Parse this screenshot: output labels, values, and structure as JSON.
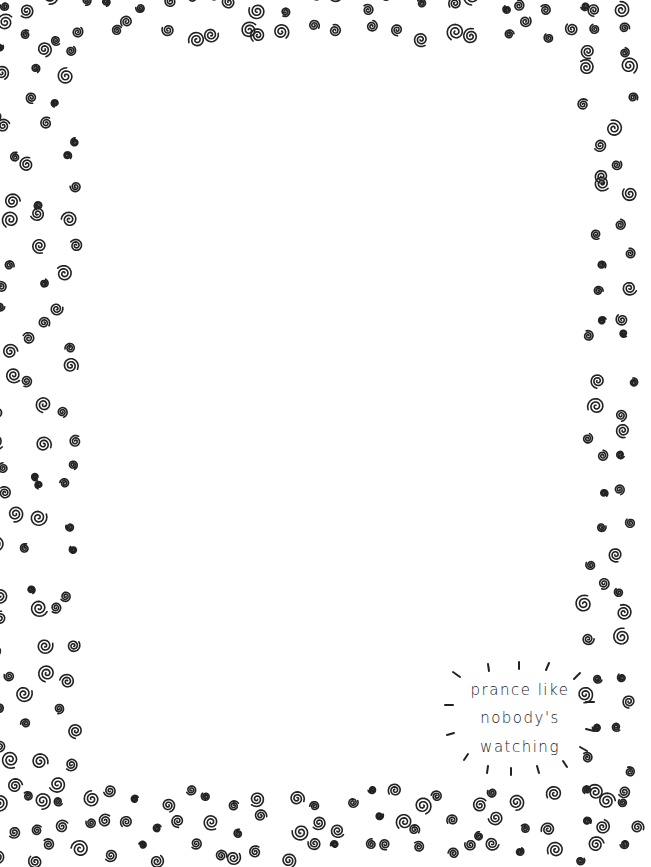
{
  "colors": {
    "ink": "#222222",
    "background": "#ffffff"
  },
  "border": {
    "icon": "swirl-icon",
    "style": "hand-drawn spirals"
  },
  "quote": {
    "lines": [
      "prance like",
      "nobody's",
      "watching"
    ],
    "decoration": "sunburst-rays"
  }
}
